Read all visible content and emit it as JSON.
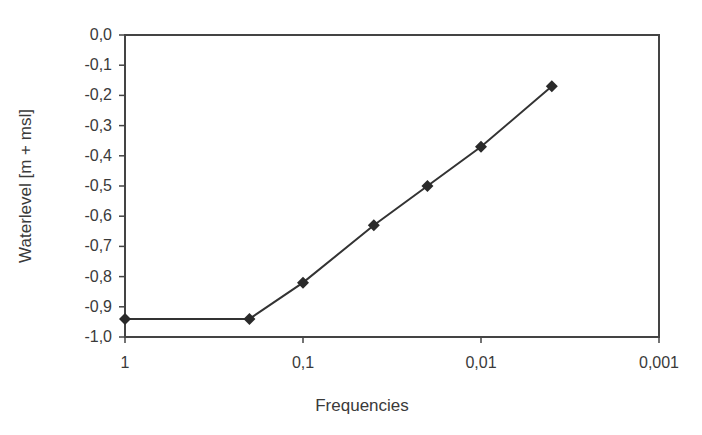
{
  "chart_data": {
    "type": "line",
    "title": "",
    "xlabel": "Frequencies",
    "ylabel": "Waterlevel [m + msl]",
    "x_scale": "log",
    "x_reversed": true,
    "xlim": [
      1,
      0.001
    ],
    "ylim": [
      -1.0,
      0.0
    ],
    "grid": false,
    "legend": null,
    "x_tick_labels": [
      "1",
      "0,1",
      "0,01",
      "0,001"
    ],
    "x_tick_values": [
      1,
      0.1,
      0.01,
      0.001
    ],
    "y_tick_labels": [
      "0,0",
      "-0,1",
      "-0,2",
      "-0,3",
      "-0,4",
      "-0,5",
      "-0,6",
      "-0,7",
      "-0,8",
      "-0,9",
      "-1,0"
    ],
    "y_tick_values": [
      0.0,
      -0.1,
      -0.2,
      -0.3,
      -0.4,
      -0.5,
      -0.6,
      -0.7,
      -0.8,
      -0.9,
      -1.0
    ],
    "series": [
      {
        "name": "Waterlevel",
        "marker": "diamond",
        "color": "#333333",
        "x": [
          1,
          0.2,
          0.1,
          0.04,
          0.02,
          0.01,
          0.004
        ],
        "values": [
          -0.94,
          -0.94,
          -0.82,
          -0.63,
          -0.5,
          -0.37,
          -0.17
        ]
      }
    ]
  },
  "colors": {
    "axis": "#444444",
    "line": "#333333",
    "marker": "#2a2a2a",
    "text": "#3a3a3a"
  }
}
